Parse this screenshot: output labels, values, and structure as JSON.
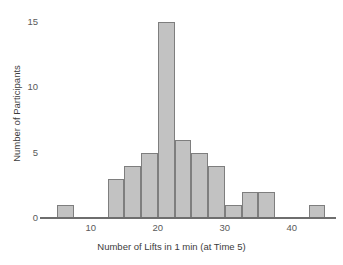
{
  "chart_data": {
    "type": "bar",
    "title": "",
    "subtitle": "",
    "xlabel": "Number of Lifts in 1 min (at Time 5)",
    "ylabel": "Number of Participants",
    "xlim": [
      3,
      46
    ],
    "ylim": [
      0,
      15.6
    ],
    "grid": false,
    "legend": null,
    "bin_width": 2.5,
    "x_ticks": [
      10,
      20,
      30,
      40
    ],
    "x_tick_labels": [
      "10",
      "20",
      "30",
      "40"
    ],
    "y_ticks": [
      0,
      5,
      10,
      15
    ],
    "y_tick_labels": [
      "0",
      "5",
      "10",
      "15"
    ],
    "bar_fill_color": "#c2c2c2",
    "bar_edge_color": "#7e7e7e",
    "axis_color": "#6e6e6e",
    "text_color": "#3c3c3c",
    "bins": [
      {
        "x0": 5.0,
        "x1": 7.5,
        "value": 1
      },
      {
        "x0": 12.5,
        "x1": 15.0,
        "value": 3
      },
      {
        "x0": 15.0,
        "x1": 17.5,
        "value": 4
      },
      {
        "x0": 17.5,
        "x1": 20.0,
        "value": 5
      },
      {
        "x0": 20.0,
        "x1": 22.5,
        "value": 15
      },
      {
        "x0": 22.5,
        "x1": 25.0,
        "value": 6
      },
      {
        "x0": 25.0,
        "x1": 27.5,
        "value": 5
      },
      {
        "x0": 27.5,
        "x1": 30.0,
        "value": 4
      },
      {
        "x0": 30.0,
        "x1": 32.5,
        "value": 1
      },
      {
        "x0": 32.5,
        "x1": 35.0,
        "value": 2
      },
      {
        "x0": 35.0,
        "x1": 37.5,
        "value": 2
      },
      {
        "x0": 42.5,
        "x1": 45.0,
        "value": 1
      }
    ],
    "categories": [
      "5-7.5",
      "12.5-15",
      "15-17.5",
      "17.5-20",
      "20-22.5",
      "22.5-25",
      "25-27.5",
      "27.5-30",
      "30-32.5",
      "32.5-35",
      "35-37.5",
      "42.5-45"
    ],
    "values": [
      1,
      3,
      4,
      5,
      15,
      6,
      5,
      4,
      1,
      2,
      2,
      1
    ]
  }
}
